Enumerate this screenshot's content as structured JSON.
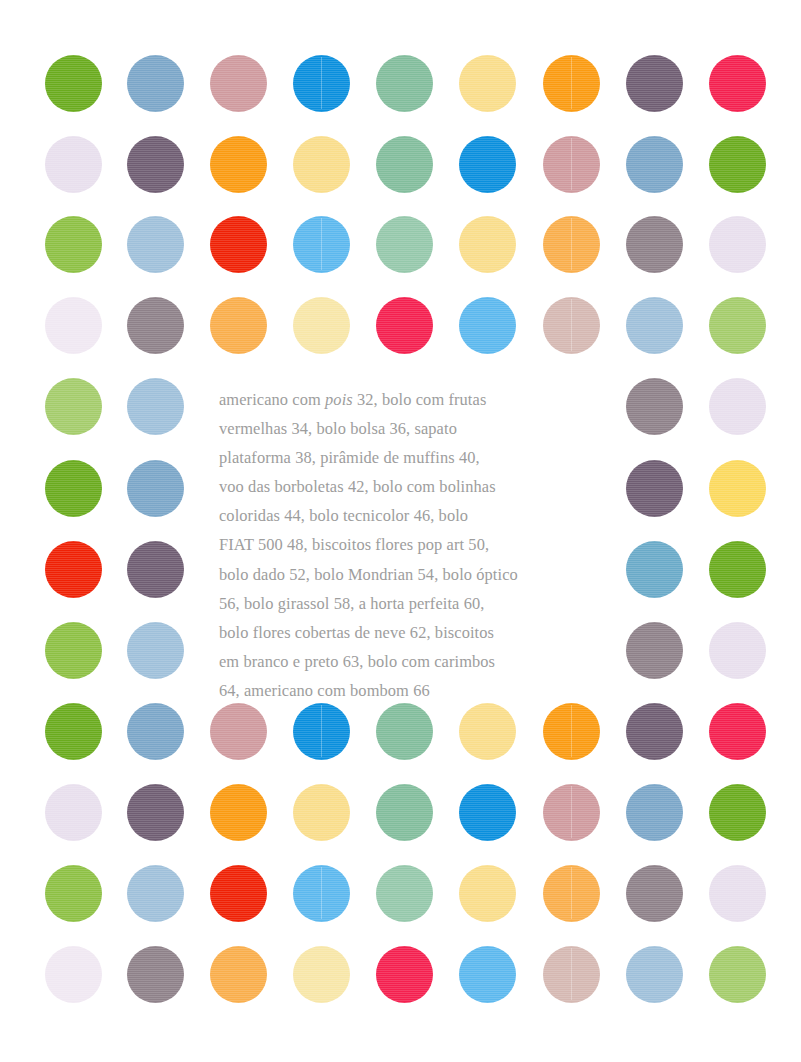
{
  "page": {
    "width": 801,
    "height": 1062,
    "background": "#ffffff"
  },
  "palette": {
    "grass_green": "#6aab1e",
    "light_green": "#8dc044",
    "pale_green": "#a4cc6b",
    "steel_blue": "#7ba6c8",
    "light_steel_blue": "#9fc0da",
    "dusty_pink": "#cf9a9e",
    "pale_dusty_pink": "#d5b8b2",
    "azure": "#0a8fdd",
    "sky_blue": "#5cb8ee",
    "seafoam": "#82bd9c",
    "seafoam_light": "#95c8ab",
    "pale_yellow": "#f9dd8b",
    "cream_yellow": "#f7e6a8",
    "orange": "#fa9b12",
    "light_orange": "#f9ae4c",
    "plum": "#6f5d72",
    "gray_mauve": "#8e8189",
    "crimson": "#f4204f",
    "pure_red": "#ef2105",
    "pale_lavender": "#e8dfed",
    "teal_blue": "#6aaac8",
    "golden_yellow": "#fbd95e"
  },
  "text_color": "#9d9d9d",
  "grid": {
    "columns": 9,
    "rows": 12,
    "dot_diameter": 57,
    "column_centers": [
      73,
      155,
      238,
      321,
      404,
      487,
      571,
      654,
      737
    ],
    "row_centers": [
      83,
      164,
      244,
      325,
      406,
      488,
      569,
      650,
      731,
      812,
      893,
      974
    ]
  },
  "dots": [
    {
      "row": 0,
      "col": 0,
      "name": "dot-r1-c1",
      "color": "#6aab1e",
      "seam": false
    },
    {
      "row": 0,
      "col": 1,
      "name": "dot-r1-c2",
      "color": "#7ba6c8",
      "seam": false
    },
    {
      "row": 0,
      "col": 2,
      "name": "dot-r1-c3",
      "color": "#cf9a9e",
      "seam": false
    },
    {
      "row": 0,
      "col": 3,
      "name": "dot-r1-c4",
      "color": "#0a8fdd",
      "seam": true
    },
    {
      "row": 0,
      "col": 4,
      "name": "dot-r1-c5",
      "color": "#82bd9c",
      "seam": false
    },
    {
      "row": 0,
      "col": 5,
      "name": "dot-r1-c6",
      "color": "#f9dd8b",
      "seam": false
    },
    {
      "row": 0,
      "col": 6,
      "name": "dot-r1-c7",
      "color": "#fa9b12",
      "seam": true
    },
    {
      "row": 0,
      "col": 7,
      "name": "dot-r1-c8",
      "color": "#6f5d72",
      "seam": false
    },
    {
      "row": 0,
      "col": 8,
      "name": "dot-r1-c9",
      "color": "#f4204f",
      "seam": false
    },
    {
      "row": 1,
      "col": 0,
      "name": "dot-r2-c1",
      "color": "#e8dfed",
      "seam": false
    },
    {
      "row": 1,
      "col": 1,
      "name": "dot-r2-c2",
      "color": "#6f5d72",
      "seam": false
    },
    {
      "row": 1,
      "col": 2,
      "name": "dot-r2-c3",
      "color": "#fa9b12",
      "seam": false
    },
    {
      "row": 1,
      "col": 3,
      "name": "dot-r2-c4",
      "color": "#f9dd8b",
      "seam": false
    },
    {
      "row": 1,
      "col": 4,
      "name": "dot-r2-c5",
      "color": "#82bd9c",
      "seam": false
    },
    {
      "row": 1,
      "col": 5,
      "name": "dot-r2-c6",
      "color": "#0a8fdd",
      "seam": false
    },
    {
      "row": 1,
      "col": 6,
      "name": "dot-r2-c7",
      "color": "#cf9a9e",
      "seam": true
    },
    {
      "row": 1,
      "col": 7,
      "name": "dot-r2-c8",
      "color": "#7ba6c8",
      "seam": false
    },
    {
      "row": 1,
      "col": 8,
      "name": "dot-r2-c9",
      "color": "#6aab1e",
      "seam": false
    },
    {
      "row": 2,
      "col": 0,
      "name": "dot-r3-c1",
      "color": "#8dc044",
      "seam": false
    },
    {
      "row": 2,
      "col": 1,
      "name": "dot-r3-c2",
      "color": "#9fc0da",
      "seam": false
    },
    {
      "row": 2,
      "col": 2,
      "name": "dot-r3-c3",
      "color": "#ef2105",
      "seam": false
    },
    {
      "row": 2,
      "col": 3,
      "name": "dot-r3-c4",
      "color": "#5cb8ee",
      "seam": true
    },
    {
      "row": 2,
      "col": 4,
      "name": "dot-r3-c5",
      "color": "#95c8ab",
      "seam": false
    },
    {
      "row": 2,
      "col": 5,
      "name": "dot-r3-c6",
      "color": "#f9dd8b",
      "seam": false
    },
    {
      "row": 2,
      "col": 6,
      "name": "dot-r3-c7",
      "color": "#f9ae4c",
      "seam": true
    },
    {
      "row": 2,
      "col": 7,
      "name": "dot-r3-c8",
      "color": "#8e8189",
      "seam": false
    },
    {
      "row": 2,
      "col": 8,
      "name": "dot-r3-c9",
      "color": "#e8dfed",
      "seam": false
    },
    {
      "row": 3,
      "col": 0,
      "name": "dot-r4-c1",
      "color": "#f0e8f2",
      "seam": false
    },
    {
      "row": 3,
      "col": 1,
      "name": "dot-r4-c2",
      "color": "#8e8189",
      "seam": false
    },
    {
      "row": 3,
      "col": 2,
      "name": "dot-r4-c3",
      "color": "#f9ae4c",
      "seam": false
    },
    {
      "row": 3,
      "col": 3,
      "name": "dot-r4-c4",
      "color": "#f7e6a8",
      "seam": false
    },
    {
      "row": 3,
      "col": 4,
      "name": "dot-r4-c5",
      "color": "#f4204f",
      "seam": false
    },
    {
      "row": 3,
      "col": 5,
      "name": "dot-r4-c6",
      "color": "#5cb8ee",
      "seam": false
    },
    {
      "row": 3,
      "col": 6,
      "name": "dot-r4-c7",
      "color": "#d5b8b2",
      "seam": true
    },
    {
      "row": 3,
      "col": 7,
      "name": "dot-r4-c8",
      "color": "#9fc0da",
      "seam": false
    },
    {
      "row": 3,
      "col": 8,
      "name": "dot-r4-c9",
      "color": "#a4cc6b",
      "seam": false
    },
    {
      "row": 4,
      "col": 0,
      "name": "dot-r5-c1",
      "color": "#a4cc6b",
      "seam": false
    },
    {
      "row": 4,
      "col": 1,
      "name": "dot-r5-c2",
      "color": "#9fc0da",
      "seam": false
    },
    {
      "row": 4,
      "col": 7,
      "name": "dot-r5-c8",
      "color": "#8e8189",
      "seam": false
    },
    {
      "row": 4,
      "col": 8,
      "name": "dot-r5-c9",
      "color": "#e8dfed",
      "seam": false
    },
    {
      "row": 5,
      "col": 0,
      "name": "dot-r6-c1",
      "color": "#6aab1e",
      "seam": false
    },
    {
      "row": 5,
      "col": 1,
      "name": "dot-r6-c2",
      "color": "#7ba6c8",
      "seam": false
    },
    {
      "row": 5,
      "col": 7,
      "name": "dot-r6-c8",
      "color": "#6f5d72",
      "seam": false
    },
    {
      "row": 5,
      "col": 8,
      "name": "dot-r6-c9",
      "color": "#fbd95e",
      "seam": false
    },
    {
      "row": 6,
      "col": 0,
      "name": "dot-r7-c1",
      "color": "#ef2105",
      "seam": false
    },
    {
      "row": 6,
      "col": 1,
      "name": "dot-r7-c2",
      "color": "#6f5d72",
      "seam": false
    },
    {
      "row": 6,
      "col": 7,
      "name": "dot-r7-c8",
      "color": "#6aaac8",
      "seam": false
    },
    {
      "row": 6,
      "col": 8,
      "name": "dot-r7-c9",
      "color": "#6aab1e",
      "seam": false
    },
    {
      "row": 7,
      "col": 0,
      "name": "dot-r8-c1",
      "color": "#8dc044",
      "seam": false
    },
    {
      "row": 7,
      "col": 1,
      "name": "dot-r8-c2",
      "color": "#9fc0da",
      "seam": false
    },
    {
      "row": 7,
      "col": 7,
      "name": "dot-r8-c8",
      "color": "#8e8189",
      "seam": false
    },
    {
      "row": 7,
      "col": 8,
      "name": "dot-r8-c9",
      "color": "#e8dfed",
      "seam": false
    },
    {
      "row": 8,
      "col": 0,
      "name": "dot-r9-c1",
      "color": "#6aab1e",
      "seam": false
    },
    {
      "row": 8,
      "col": 1,
      "name": "dot-r9-c2",
      "color": "#7ba6c8",
      "seam": false
    },
    {
      "row": 8,
      "col": 2,
      "name": "dot-r9-c3",
      "color": "#cf9a9e",
      "seam": false
    },
    {
      "row": 8,
      "col": 3,
      "name": "dot-r9-c4",
      "color": "#0a8fdd",
      "seam": true
    },
    {
      "row": 8,
      "col": 4,
      "name": "dot-r9-c5",
      "color": "#82bd9c",
      "seam": false
    },
    {
      "row": 8,
      "col": 5,
      "name": "dot-r9-c6",
      "color": "#f9dd8b",
      "seam": false
    },
    {
      "row": 8,
      "col": 6,
      "name": "dot-r9-c7",
      "color": "#fa9b12",
      "seam": true
    },
    {
      "row": 8,
      "col": 7,
      "name": "dot-r9-c8",
      "color": "#6f5d72",
      "seam": false
    },
    {
      "row": 8,
      "col": 8,
      "name": "dot-r9-c9",
      "color": "#f4204f",
      "seam": false
    },
    {
      "row": 9,
      "col": 0,
      "name": "dot-r10-c1",
      "color": "#e8dfed",
      "seam": false
    },
    {
      "row": 9,
      "col": 1,
      "name": "dot-r10-c2",
      "color": "#6f5d72",
      "seam": false
    },
    {
      "row": 9,
      "col": 2,
      "name": "dot-r10-c3",
      "color": "#fa9b12",
      "seam": false
    },
    {
      "row": 9,
      "col": 3,
      "name": "dot-r10-c4",
      "color": "#f9dd8b",
      "seam": false
    },
    {
      "row": 9,
      "col": 4,
      "name": "dot-r10-c5",
      "color": "#82bd9c",
      "seam": false
    },
    {
      "row": 9,
      "col": 5,
      "name": "dot-r10-c6",
      "color": "#0a8fdd",
      "seam": false
    },
    {
      "row": 9,
      "col": 6,
      "name": "dot-r10-c7",
      "color": "#cf9a9e",
      "seam": true
    },
    {
      "row": 9,
      "col": 7,
      "name": "dot-r10-c8",
      "color": "#7ba6c8",
      "seam": false
    },
    {
      "row": 9,
      "col": 8,
      "name": "dot-r10-c9",
      "color": "#6aab1e",
      "seam": false
    },
    {
      "row": 10,
      "col": 0,
      "name": "dot-r11-c1",
      "color": "#8dc044",
      "seam": false
    },
    {
      "row": 10,
      "col": 1,
      "name": "dot-r11-c2",
      "color": "#9fc0da",
      "seam": false
    },
    {
      "row": 10,
      "col": 2,
      "name": "dot-r11-c3",
      "color": "#ef2105",
      "seam": false
    },
    {
      "row": 10,
      "col": 3,
      "name": "dot-r11-c4",
      "color": "#5cb8ee",
      "seam": true
    },
    {
      "row": 10,
      "col": 4,
      "name": "dot-r11-c5",
      "color": "#95c8ab",
      "seam": false
    },
    {
      "row": 10,
      "col": 5,
      "name": "dot-r11-c6",
      "color": "#f9dd8b",
      "seam": false
    },
    {
      "row": 10,
      "col": 6,
      "name": "dot-r11-c7",
      "color": "#f9ae4c",
      "seam": true
    },
    {
      "row": 10,
      "col": 7,
      "name": "dot-r11-c8",
      "color": "#8e8189",
      "seam": false
    },
    {
      "row": 10,
      "col": 8,
      "name": "dot-r11-c9",
      "color": "#e8dfed",
      "seam": false
    },
    {
      "row": 11,
      "col": 0,
      "name": "dot-r12-c1",
      "color": "#f0e8f2",
      "seam": false
    },
    {
      "row": 11,
      "col": 1,
      "name": "dot-r12-c2",
      "color": "#8e8189",
      "seam": false
    },
    {
      "row": 11,
      "col": 2,
      "name": "dot-r12-c3",
      "color": "#f9ae4c",
      "seam": false
    },
    {
      "row": 11,
      "col": 3,
      "name": "dot-r12-c4",
      "color": "#f7e6a8",
      "seam": false
    },
    {
      "row": 11,
      "col": 4,
      "name": "dot-r12-c5",
      "color": "#f4204f",
      "seam": false
    },
    {
      "row": 11,
      "col": 5,
      "name": "dot-r12-c6",
      "color": "#5cb8ee",
      "seam": false
    },
    {
      "row": 11,
      "col": 6,
      "name": "dot-r12-c7",
      "color": "#d5b8b2",
      "seam": true
    },
    {
      "row": 11,
      "col": 7,
      "name": "dot-r12-c8",
      "color": "#9fc0da",
      "seam": false
    },
    {
      "row": 11,
      "col": 8,
      "name": "dot-r12-c9",
      "color": "#a4cc6b",
      "seam": false
    }
  ],
  "contents_block": {
    "x": 219,
    "y": 385,
    "width": 396,
    "lines": [
      [
        {
          "t": "americano com ",
          "italic": false
        },
        {
          "t": "pois",
          "italic": true
        },
        {
          "t": " 32, bolo com frutas",
          "italic": false
        }
      ],
      [
        {
          "t": "vermelhas 34, bolo bolsa 36, sapato",
          "italic": false
        }
      ],
      [
        {
          "t": "plataforma 38, pirâmide de muffins 40,",
          "italic": false
        }
      ],
      [
        {
          "t": "voo das borboletas 42, bolo com bolinhas",
          "italic": false
        }
      ],
      [
        {
          "t": "coloridas 44, bolo tecnicolor 46, bolo",
          "italic": false
        }
      ],
      [
        {
          "t": "FIAT 500 48, biscoitos flores pop art 50,",
          "italic": false
        }
      ],
      [
        {
          "t": "bolo dado 52, bolo Mondrian 54, bolo óptico",
          "italic": false
        }
      ],
      [
        {
          "t": "56, bolo girassol 58, a horta perfeita 60,",
          "italic": false
        }
      ],
      [
        {
          "t": "bolo flores cobertas de neve 62, biscoitos",
          "italic": false
        }
      ],
      [
        {
          "t": "em branco e preto 63, bolo com carimbos",
          "italic": false
        }
      ],
      [
        {
          "t": "64, americano com bombom 66",
          "italic": false
        }
      ]
    ],
    "entries": [
      {
        "title": "americano com pois",
        "page": "32"
      },
      {
        "title": "bolo com frutas vermelhas",
        "page": "34"
      },
      {
        "title": "bolo bolsa",
        "page": "36"
      },
      {
        "title": "sapato plataforma",
        "page": "38"
      },
      {
        "title": "pirâmide de muffins",
        "page": "40"
      },
      {
        "title": "voo das borboletas",
        "page": "42"
      },
      {
        "title": "bolo com bolinhas coloridas",
        "page": "44"
      },
      {
        "title": "bolo tecnicolor",
        "page": "46"
      },
      {
        "title": "bolo FIAT 500",
        "page": "48"
      },
      {
        "title": "biscoitos flores pop art",
        "page": "50"
      },
      {
        "title": "bolo dado",
        "page": "52"
      },
      {
        "title": "bolo Mondrian",
        "page": "54"
      },
      {
        "title": "bolo óptico",
        "page": "56"
      },
      {
        "title": "bolo girassol",
        "page": "58"
      },
      {
        "title": "a horta perfeita",
        "page": "60"
      },
      {
        "title": "bolo flores cobertas de neve",
        "page": "62"
      },
      {
        "title": "biscoitos em branco e preto",
        "page": "63"
      },
      {
        "title": "bolo com carimbos",
        "page": "64"
      },
      {
        "title": "americano com bombom",
        "page": "66"
      }
    ]
  }
}
